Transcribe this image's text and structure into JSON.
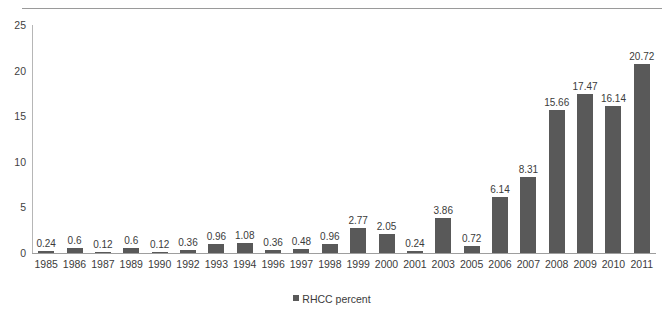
{
  "page": {
    "header_fragment": "",
    "background_color": "#ffffff"
  },
  "chart_data": {
    "type": "bar",
    "title": "",
    "subtitle": "",
    "xlabel": "",
    "ylabel": "",
    "ylim": [
      0,
      25
    ],
    "yticks": [
      0,
      5,
      10,
      15,
      20,
      25
    ],
    "grid": false,
    "legend_position": "bottom",
    "bar_color": "#595959",
    "data_labels": true,
    "categories": [
      "1985",
      "1986",
      "1987",
      "1989",
      "1990",
      "1992",
      "1993",
      "1994",
      "1996",
      "1997",
      "1998",
      "1999",
      "2000",
      "2001",
      "2003",
      "2005",
      "2006",
      "2007",
      "2008",
      "2009",
      "2010",
      "2011"
    ],
    "series": [
      {
        "name": "RHCC percent",
        "color": "#595959",
        "values": [
          0.24,
          0.6,
          0.12,
          0.6,
          0.12,
          0.36,
          0.96,
          1.08,
          0.36,
          0.48,
          0.96,
          2.77,
          2.05,
          0.24,
          3.86,
          0.72,
          6.14,
          8.31,
          15.66,
          17.47,
          16.14,
          20.72
        ],
        "value_labels": [
          "0.24",
          "0.6",
          "0.12",
          "0.6",
          "0.12",
          "0.36",
          "0.96",
          "1.08",
          "0.36",
          "0.48",
          "0.96",
          "2.77",
          "2.05",
          "0.24",
          "3.86",
          "0.72",
          "6.14",
          "8.31",
          "15.66",
          "17.47",
          "16.14",
          "20.72"
        ]
      }
    ],
    "legend": [
      {
        "label": "RHCC percent",
        "color": "#595959"
      }
    ]
  }
}
